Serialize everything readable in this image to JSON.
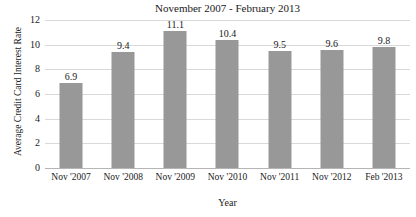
{
  "chart_data": {
    "type": "bar",
    "title": "November 2007 - February 2013",
    "xlabel": "Year",
    "ylabel": "Average Credit Card Interest Rate",
    "categories": [
      "Nov '2007",
      "Nov '2008",
      "Nov '2009",
      "Nov '2010",
      "Nov '2011",
      "Nov '2012",
      "Feb '2013"
    ],
    "values": [
      6.9,
      9.4,
      11.1,
      10.4,
      9.5,
      9.6,
      9.8
    ],
    "value_labels": [
      "6.9",
      "9.4",
      "11.1",
      "10.4",
      "9.5",
      "9.6",
      "9.8"
    ],
    "ylim": [
      0,
      12
    ],
    "yticks": [
      0,
      2,
      4,
      6,
      8,
      10,
      12
    ],
    "ytick_labels": [
      "0",
      "2",
      "4",
      "6",
      "8",
      "10",
      "12"
    ],
    "grid": true,
    "grid_axis": "y",
    "legend": false,
    "bar_color": "#989898",
    "grid_color": "#d9d9d9",
    "axis_color": "#b5b5b5",
    "background_color": "#ffffff",
    "text_color": "#1a1a1a"
  }
}
